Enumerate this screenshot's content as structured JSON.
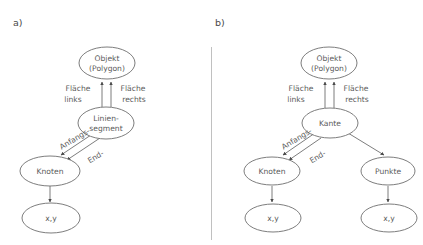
{
  "figure": {
    "title": "",
    "panels": [
      {
        "letter": "a)",
        "id": "panel-a",
        "nodes": [
          {
            "id": "objekt",
            "lines": [
              "Objekt",
              "(Polygon)"
            ],
            "cx": 107,
            "cy": 63,
            "rx": 28,
            "ry": 16
          },
          {
            "id": "liniensegment",
            "lines": [
              "Linien-",
              "segment"
            ],
            "cx": 106,
            "cy": 123,
            "rx": 28,
            "ry": 16
          },
          {
            "id": "knoten",
            "lines": [
              "Knoten"
            ],
            "cx": 50,
            "cy": 171,
            "rx": 30,
            "ry": 15
          },
          {
            "id": "xy",
            "lines": [
              "x,y"
            ],
            "cx": 51,
            "cy": 218,
            "rx": 29,
            "ry": 15
          }
        ],
        "edge_labels": [
          {
            "id": "flaeche-links",
            "lines": [
              "Fläche",
              "links"
            ],
            "x": 78,
            "y": 89
          },
          {
            "id": "flaeche-rechts",
            "lines": [
              "Fläche",
              "rechts"
            ],
            "x": 132,
            "y": 89
          },
          {
            "id": "anfangs",
            "text": "Anfangs-",
            "x": 75,
            "y": 142,
            "rotate": -31
          },
          {
            "id": "end",
            "text": "End-",
            "x": 94,
            "y": 158,
            "rotate": -31
          }
        ]
      },
      {
        "letter": "b)",
        "id": "panel-b",
        "nodes": [
          {
            "id": "objekt",
            "lines": [
              "Objekt",
              "(Polygon)"
            ],
            "cx": 329,
            "cy": 63,
            "rx": 28,
            "ry": 16
          },
          {
            "id": "kante",
            "lines": [
              "Kante"
            ],
            "cx": 330,
            "cy": 123,
            "rx": 28,
            "ry": 15
          },
          {
            "id": "knoten",
            "lines": [
              "Knoten"
            ],
            "cx": 272,
            "cy": 171,
            "rx": 28,
            "ry": 14
          },
          {
            "id": "punkte",
            "lines": [
              "Punkte"
            ],
            "cx": 388,
            "cy": 171,
            "rx": 27,
            "ry": 14
          },
          {
            "id": "xy-left",
            "lines": [
              "x,y"
            ],
            "cx": 273,
            "cy": 218,
            "rx": 28,
            "ry": 14
          },
          {
            "id": "xy-right",
            "lines": [
              "x,y"
            ],
            "cx": 389,
            "cy": 218,
            "rx": 28,
            "ry": 14
          }
        ],
        "edge_labels": [
          {
            "id": "flaeche-links",
            "lines": [
              "Fläche",
              "links"
            ],
            "x": 301,
            "y": 89
          },
          {
            "id": "flaeche-rechts",
            "lines": [
              "Fläche",
              "rechts"
            ],
            "x": 355,
            "y": 89
          },
          {
            "id": "anfangs",
            "text": "Anfangs-",
            "x": 297,
            "y": 142,
            "rotate": -31
          },
          {
            "id": "end",
            "text": "End-",
            "x": 316,
            "y": 158,
            "rotate": -31
          }
        ]
      }
    ]
  },
  "text": {
    "panel_a_letter": "a)",
    "panel_b_letter": "b)",
    "objekt_line1": "Objekt",
    "objekt_line2": "(Polygon)",
    "liniensegment_line1": "Linien-",
    "liniensegment_line2": "segment",
    "kante": "Kante",
    "knoten": "Knoten",
    "punkte": "Punkte",
    "xy": "x,y",
    "flaeche": "Fläche",
    "links": "links",
    "rechts": "rechts",
    "anfangs": "Anfangs-",
    "end": "End-"
  },
  "colors": {
    "background": "#ffffff",
    "stroke": "#6e6e6e",
    "text": "#5a5a5a",
    "divider": "#b9b9b9",
    "arrow": "#4a4a4a"
  }
}
